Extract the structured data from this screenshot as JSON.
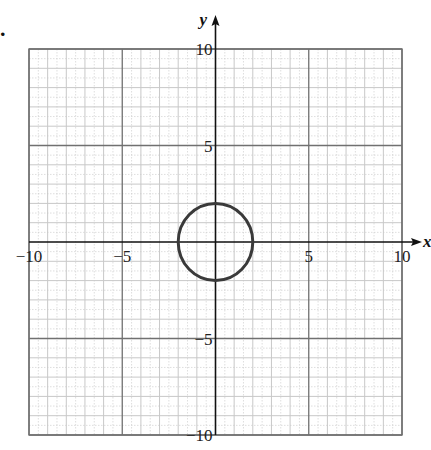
{
  "chart_data": {
    "type": "line",
    "title": "",
    "xlabel": "x",
    "ylabel": "y",
    "xlim": [
      -10,
      10
    ],
    "ylim": [
      -10,
      10
    ],
    "grid": true,
    "grid_minor_step": 1,
    "grid_major_step": 5,
    "x_tick_labels": [
      "−10",
      "−5",
      "5",
      "10"
    ],
    "x_ticks": [
      -10,
      -5,
      5,
      10
    ],
    "y_tick_labels": [
      "10",
      "5",
      "−5",
      "−10"
    ],
    "y_ticks": [
      10,
      5,
      -5,
      -10
    ],
    "series": [
      {
        "name": "circle",
        "shape": "circle",
        "center": [
          0,
          0
        ],
        "radius": 2,
        "equation": "x^2 + y^2 = 4"
      }
    ],
    "legend": null
  },
  "labels": {
    "x_axis": "x",
    "y_axis": "y",
    "question_marker": "."
  },
  "colors": {
    "grid_minor": "#c8c8c8",
    "grid_major": "#707070",
    "axis": "#111111",
    "curve": "#3a3a3a"
  }
}
